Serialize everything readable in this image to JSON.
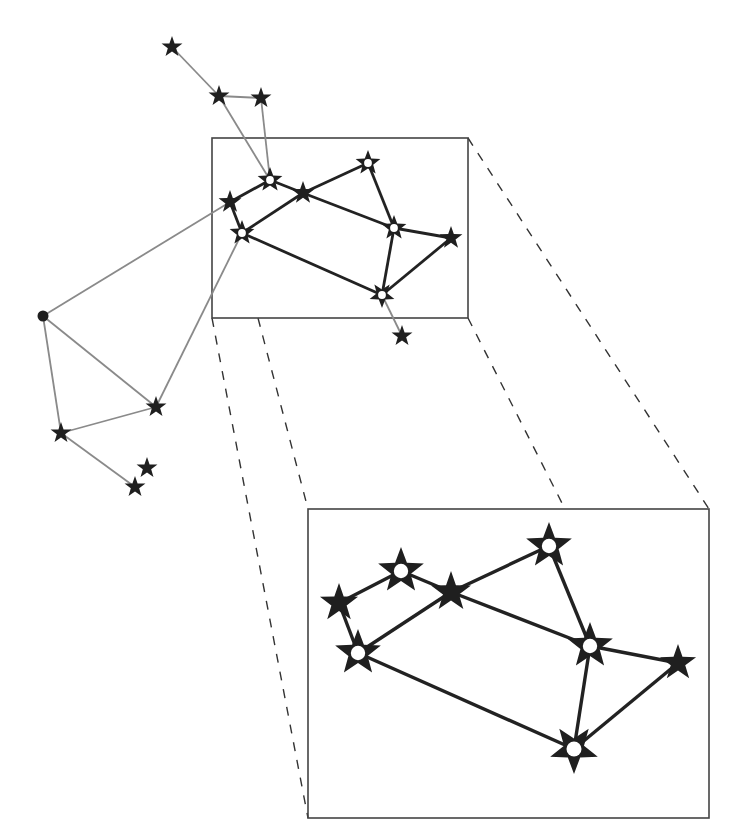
{
  "colors": {
    "background": "#ffffff",
    "star": "#1f1f1f",
    "edge_outer": "#8a8a8a",
    "edge_inner": "#222222",
    "frame": "#444444",
    "dash": "#333333",
    "hollow_center": "#ffffff"
  },
  "detail_box": {
    "x": 212,
    "y": 138,
    "w": 256,
    "h": 180
  },
  "zoom_box": {
    "x": 308,
    "y": 509,
    "w": 401,
    "h": 309
  },
  "dashed_connectors": [
    {
      "x1": 212,
      "y1": 318,
      "x2": 308,
      "y2": 818
    },
    {
      "x1": 258,
      "y1": 318,
      "x2": 308,
      "y2": 509
    },
    {
      "x1": 468,
      "y1": 138,
      "x2": 709,
      "y2": 509
    },
    {
      "x1": 468,
      "y1": 318,
      "x2": 565,
      "y2": 509
    }
  ],
  "overview": {
    "nodes": [
      {
        "id": "T1",
        "x": 172,
        "y": 47,
        "type": "star",
        "r": 11
      },
      {
        "id": "T2",
        "x": 219,
        "y": 96,
        "type": "star",
        "r": 11
      },
      {
        "id": "T3",
        "x": 261,
        "y": 98,
        "type": "star",
        "r": 11
      },
      {
        "id": "DOT",
        "x": 43,
        "y": 316,
        "type": "dot",
        "r": 5.5
      },
      {
        "id": "L1",
        "x": 61,
        "y": 433,
        "type": "star",
        "r": 11
      },
      {
        "id": "L2",
        "x": 156,
        "y": 407,
        "type": "star",
        "r": 11
      },
      {
        "id": "L3",
        "x": 135,
        "y": 487,
        "type": "star",
        "r": 11
      },
      {
        "id": "L4",
        "x": 147,
        "y": 468,
        "type": "star",
        "r": 11
      },
      {
        "id": "A",
        "x": 230,
        "y": 202,
        "type": "star",
        "r": 12
      },
      {
        "id": "B",
        "x": 270,
        "y": 180,
        "type": "hollow",
        "r": 13
      },
      {
        "id": "C",
        "x": 303,
        "y": 193,
        "type": "star",
        "r": 12
      },
      {
        "id": "D",
        "x": 368,
        "y": 163,
        "type": "hollow",
        "r": 13
      },
      {
        "id": "E",
        "x": 394,
        "y": 228,
        "type": "hollow",
        "r": 13
      },
      {
        "id": "F",
        "x": 451,
        "y": 238,
        "type": "star",
        "r": 12
      },
      {
        "id": "G",
        "x": 382,
        "y": 295,
        "type": "hollow",
        "r": 13,
        "inverted": true
      },
      {
        "id": "H",
        "x": 242,
        "y": 233,
        "type": "hollow",
        "r": 13
      },
      {
        "id": "S",
        "x": 402,
        "y": 336,
        "type": "star",
        "r": 11
      }
    ],
    "outer_edges": [
      [
        "T1",
        "T2"
      ],
      [
        "T2",
        "T3"
      ],
      [
        "T2",
        "B"
      ],
      [
        "T3",
        "B"
      ],
      [
        "DOT",
        "A"
      ],
      [
        "DOT",
        "L1"
      ],
      [
        "DOT",
        "L2"
      ],
      [
        "L1",
        "L2"
      ],
      [
        "L1",
        "L3"
      ],
      [
        "H",
        "L2"
      ],
      [
        "G",
        "S"
      ]
    ],
    "inner_edges": [
      [
        "A",
        "B"
      ],
      [
        "B",
        "C"
      ],
      [
        "C",
        "D"
      ],
      [
        "D",
        "E"
      ],
      [
        "C",
        "E"
      ],
      [
        "A",
        "H"
      ],
      [
        "H",
        "C"
      ],
      [
        "H",
        "G"
      ],
      [
        "E",
        "F"
      ],
      [
        "E",
        "G"
      ],
      [
        "G",
        "F"
      ]
    ]
  },
  "zoomed": {
    "nodes": [
      {
        "id": "A",
        "x": 339,
        "y": 603,
        "type": "star",
        "r": 20
      },
      {
        "id": "B",
        "x": 401,
        "y": 571,
        "type": "hollow",
        "r": 24
      },
      {
        "id": "C",
        "x": 451,
        "y": 592,
        "type": "star",
        "r": 21
      },
      {
        "id": "D",
        "x": 549,
        "y": 546,
        "type": "hollow",
        "r": 24
      },
      {
        "id": "E",
        "x": 590,
        "y": 646,
        "type": "hollow",
        "r": 24
      },
      {
        "id": "F",
        "x": 678,
        "y": 663,
        "type": "star",
        "r": 19
      },
      {
        "id": "G",
        "x": 574,
        "y": 749,
        "type": "hollow",
        "r": 25,
        "inverted": true
      },
      {
        "id": "H",
        "x": 358,
        "y": 653,
        "type": "hollow",
        "r": 24
      }
    ],
    "edges": [
      [
        "A",
        "B"
      ],
      [
        "B",
        "C"
      ],
      [
        "C",
        "D"
      ],
      [
        "D",
        "E"
      ],
      [
        "C",
        "E"
      ],
      [
        "A",
        "H"
      ],
      [
        "H",
        "C"
      ],
      [
        "H",
        "G"
      ],
      [
        "E",
        "F"
      ],
      [
        "E",
        "G"
      ],
      [
        "G",
        "F"
      ]
    ]
  }
}
